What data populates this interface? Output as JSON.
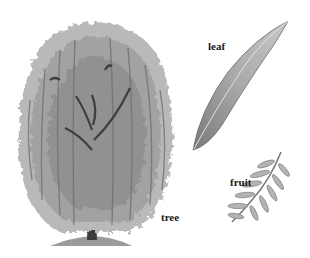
{
  "diagram": {
    "parts": [
      {
        "id": "tree",
        "label": "tree"
      },
      {
        "id": "leaf",
        "label": "leaf"
      },
      {
        "id": "fruit",
        "label": "fruit"
      }
    ]
  },
  "colors": {
    "background": "#ffffff",
    "foliage_light": "#b8b8b8",
    "foliage_mid": "#8f8f8f",
    "foliage_dark": "#5a5a5a",
    "trunk": "#3c3c3c",
    "label": "#1a1a1a"
  }
}
